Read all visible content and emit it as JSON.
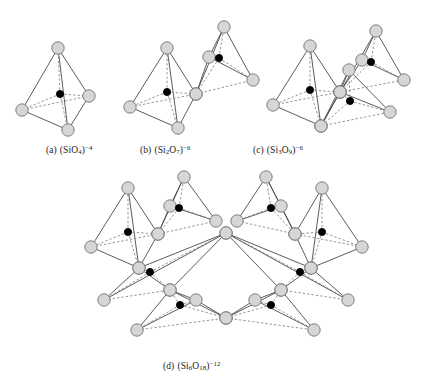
{
  "figure": {
    "background_color": "#ffffff",
    "width": 423,
    "height": 388
  },
  "atoms": {
    "oxygen": {
      "label": "oxygen-vertex",
      "fill": "#d6d6d6",
      "stroke": "#6b6b6b",
      "radius": 6.2
    },
    "silicon": {
      "label": "silicon-center",
      "fill": "#000000",
      "stroke": "#000000",
      "radius": 3.6
    }
  },
  "bonds": {
    "solid_stroke": "#4a4a4a",
    "dashed_stroke": "#7a7a7a",
    "solid_width": 0.9,
    "dashed_width": 0.8,
    "dash_pattern": "2.4,2.0"
  },
  "captions": {
    "a": {
      "tag": "(a)",
      "open": "(Si",
      "sub1": "",
      "o": "O",
      "sub2": "4",
      "close": ")",
      "charge": "−4"
    },
    "b": {
      "tag": "(b)",
      "open": "(Si",
      "sub1": "2",
      "o": "O",
      "sub2": "7",
      "close": ")",
      "charge": "−6"
    },
    "c": {
      "tag": "(c)",
      "open": "(Si",
      "sub1": "3",
      "o": "O",
      "sub2": "9",
      "close": ")",
      "charge": "−6"
    },
    "d": {
      "tag": "(d)",
      "open": "(Si",
      "sub1": "6",
      "o": "O",
      "sub2": "18",
      "close": ")",
      "charge": "−12"
    }
  },
  "structures": [
    {
      "id": "a",
      "name": "orthosilicate-single-tetrahedron",
      "tetrahedra": [
        {
          "apex": [
            58,
            48
          ],
          "left": [
            22,
            110
          ],
          "right": [
            89,
            96
          ],
          "front": [
            68,
            130
          ],
          "center": [
            60,
            94
          ]
        }
      ]
    },
    {
      "id": "b",
      "name": "pyrosilicate-double-tetrahedron",
      "tetrahedra": [
        {
          "apex": [
            167,
            48
          ],
          "left": [
            130,
            107
          ],
          "right": [
            196,
            94
          ],
          "front": [
            178,
            128
          ],
          "center": [
            167,
            92
          ]
        },
        {
          "apex": [
            224,
            27
          ],
          "left": [
            196,
            94
          ],
          "right": [
            253,
            80
          ],
          "front": [
            209,
            57
          ],
          "center": [
            219,
            58
          ]
        }
      ]
    },
    {
      "id": "c",
      "name": "cyclic-trisilicate-ring",
      "tetrahedra": [
        {
          "apex": [
            310,
            46
          ],
          "left": [
            273,
            105
          ],
          "right": [
            340,
            92
          ],
          "front": [
            321,
            126
          ],
          "center": [
            310,
            90
          ]
        },
        {
          "apex": [
            376,
            31
          ],
          "left": [
            340,
            92
          ],
          "right": [
            404,
            80
          ],
          "front": [
            362,
            60
          ],
          "center": [
            371,
            62
          ]
        },
        {
          "apex": [
            349,
            70
          ],
          "left": [
            321,
            126
          ],
          "right": [
            390,
            112
          ],
          "front": [
            340,
            92
          ],
          "center": [
            350,
            101
          ]
        }
      ]
    },
    {
      "id": "d",
      "name": "cyclic-hexasilicate-ring",
      "tetrahedra": [
        {
          "apex": [
            128,
            188
          ],
          "left": [
            91,
            247
          ],
          "right": [
            158,
            234
          ],
          "front": [
            139,
            268
          ],
          "center": [
            128,
            232
          ]
        },
        {
          "apex": [
            184,
            177
          ],
          "left": [
            158,
            234
          ],
          "right": [
            216,
            221
          ],
          "front": [
            170,
            206
          ],
          "center": [
            179,
            208
          ]
        },
        {
          "apex": [
            266,
            177
          ],
          "left": [
            237,
            221
          ],
          "right": [
            295,
            234
          ],
          "front": [
            281,
            206
          ],
          "center": [
            271,
            208
          ]
        },
        {
          "apex": [
            322,
            188
          ],
          "left": [
            295,
            234
          ],
          "right": [
            362,
            247
          ],
          "front": [
            311,
            268
          ],
          "center": [
            322,
            232
          ]
        },
        {
          "apex": [
            139,
            268
          ],
          "left": [
            104,
            300
          ],
          "right": [
            170,
            290
          ],
          "front": [
            226,
            233
          ],
          "center": [
            150,
            272
          ]
        },
        {
          "apex": [
            311,
            268
          ],
          "left": [
            281,
            290
          ],
          "right": [
            348,
            300
          ],
          "front": [
            226,
            233
          ],
          "center": [
            300,
            272
          ]
        },
        {
          "apex": [
            170,
            290
          ],
          "left": [
            137,
            330
          ],
          "right": [
            226,
            318
          ],
          "front": [
            196,
            300
          ],
          "center": [
            180,
            305
          ]
        },
        {
          "apex": [
            281,
            290
          ],
          "left": [
            226,
            318
          ],
          "right": [
            314,
            330
          ],
          "front": [
            255,
            300
          ],
          "center": [
            271,
            305
          ]
        }
      ]
    }
  ]
}
